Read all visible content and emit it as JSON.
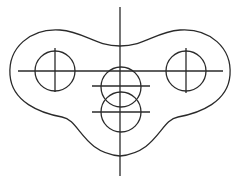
{
  "diagram": {
    "type": "mechanical-part-drawing",
    "colors": {
      "background": "#ffffff",
      "line": "#2a2a2a"
    },
    "outline": {
      "path": "M 120 46 C 95 46, 85 32, 60 30 C 30 28, 8 48, 10 75 C 12 102, 40 113, 62 117 C 80 120, 82 152, 120 156 C 158 152, 160 120, 178 117 C 200 113, 228 102, 230 75 C 232 48, 210 28, 180 30 C 155 32, 145 46, 120 46 Z"
    },
    "circles": [
      {
        "name": "left-hole",
        "cx": 55,
        "cy": 71,
        "r": 20
      },
      {
        "name": "right-hole",
        "cx": 186,
        "cy": 71,
        "r": 20
      },
      {
        "name": "upper-center-hole",
        "cx": 121,
        "cy": 87,
        "r": 20
      },
      {
        "name": "lower-center-hole",
        "cx": 121,
        "cy": 112,
        "r": 20
      }
    ],
    "center_lines": [
      {
        "name": "vertical-axis",
        "x1": 120,
        "y1": 7,
        "x2": 120,
        "y2": 176
      },
      {
        "name": "horizontal-axis",
        "x1": 18,
        "y1": 71,
        "x2": 223,
        "y2": 71
      },
      {
        "name": "left-hole-vertical",
        "x1": 55,
        "y1": 48,
        "x2": 55,
        "y2": 92
      },
      {
        "name": "right-hole-vertical",
        "x1": 186,
        "y1": 48,
        "x2": 186,
        "y2": 93
      },
      {
        "name": "upper-center-horizontal",
        "x1": 92,
        "y1": 86,
        "x2": 150,
        "y2": 86
      },
      {
        "name": "lower-center-horizontal",
        "x1": 92,
        "y1": 112,
        "x2": 150,
        "y2": 112
      }
    ]
  }
}
